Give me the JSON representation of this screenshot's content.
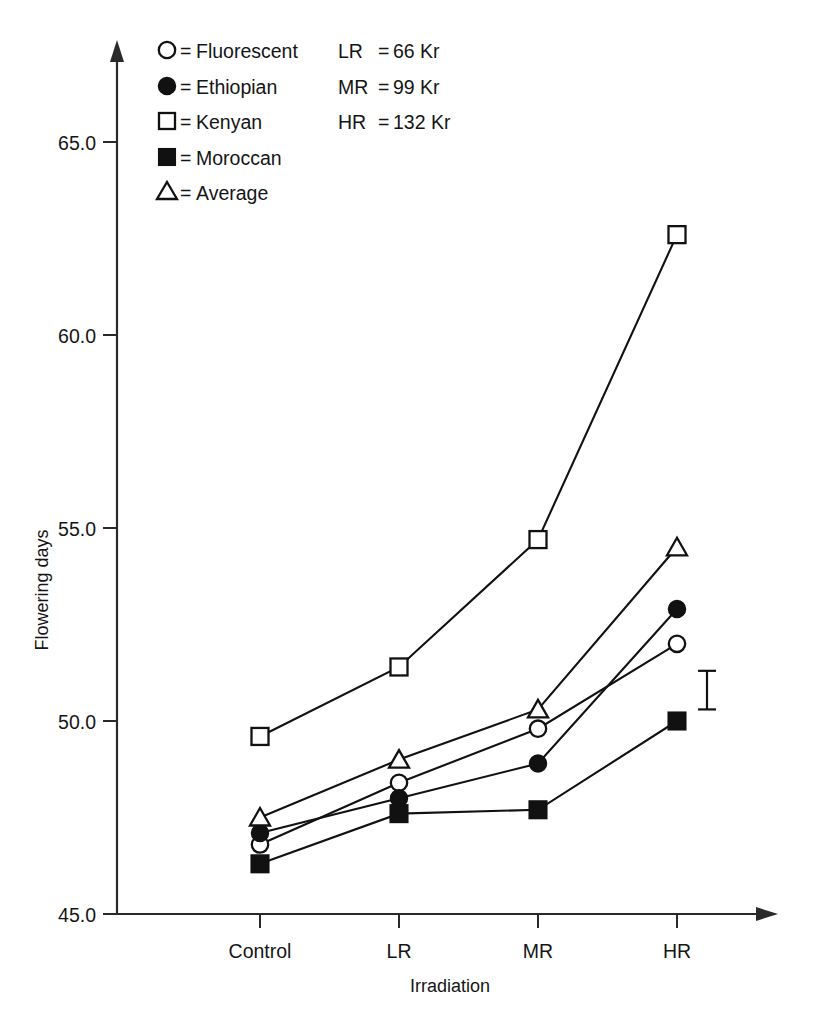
{
  "chart_data": {
    "type": "line",
    "title": "",
    "xlabel": "Irradiation",
    "ylabel": "Flowering days",
    "categories": [
      "Control",
      "LR",
      "MR",
      "HR"
    ],
    "ylim": [
      45.0,
      65.0
    ],
    "ytick_labels": [
      "45.0",
      "50.0",
      "55.0",
      "60.0",
      "65.0"
    ],
    "ytick_values": [
      45.0,
      50.0,
      55.0,
      60.0,
      65.0
    ],
    "grid": false,
    "legend_position": "top-left",
    "series": [
      {
        "name": "Fluorescent",
        "marker": "open-circle",
        "values": [
          46.8,
          48.4,
          49.8,
          52.0
        ]
      },
      {
        "name": "Ethiopian",
        "marker": "filled-circle",
        "values": [
          47.1,
          48.0,
          48.9,
          52.9
        ]
      },
      {
        "name": "Kenyan",
        "marker": "open-square",
        "values": [
          49.6,
          51.4,
          54.7,
          62.6
        ]
      },
      {
        "name": "Moroccan",
        "marker": "filled-square",
        "values": [
          46.3,
          47.6,
          47.7,
          50.0
        ]
      },
      {
        "name": "Average",
        "marker": "open-triangle",
        "values": [
          47.5,
          49.0,
          50.3,
          54.5
        ]
      }
    ],
    "error_bar": {
      "label": "",
      "low": 50.3,
      "high": 51.3,
      "x_position": 707
    }
  },
  "legend": {
    "series_entries": [
      {
        "marker": "open-circle",
        "equals": "=",
        "label": "Fluorescent"
      },
      {
        "marker": "filled-circle",
        "equals": "=",
        "label": "Ethiopian"
      },
      {
        "marker": "open-square",
        "equals": "=",
        "label": "Kenyan"
      },
      {
        "marker": "filled-square",
        "equals": "=",
        "label": "Moroccan"
      },
      {
        "marker": "open-triangle",
        "equals": "=",
        "label": "Average"
      }
    ],
    "dose_entries": [
      {
        "code": "LR",
        "equals": "=",
        "value": "66 Kr"
      },
      {
        "code": "MR",
        "equals": "=",
        "value": "99 Kr"
      },
      {
        "code": "HR",
        "equals": "=",
        "value": "132 Kr"
      }
    ]
  },
  "axes": {
    "y_label": "Flowering days",
    "x_label": "Irradiation",
    "y_ticks": [
      "65.0",
      "60.0",
      "55.0",
      "50.0",
      "45.0"
    ],
    "x_ticks": [
      "Control",
      "LR",
      "MR",
      "HR"
    ]
  },
  "colors": {
    "ink": "#111111",
    "background": "#ffffff"
  }
}
